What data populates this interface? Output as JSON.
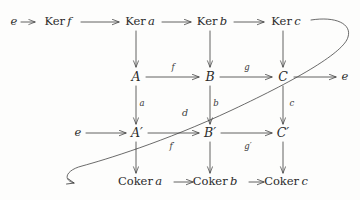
{
  "diagram": {
    "background_color": "#fdfdfc",
    "ink_color": "#3a3a3a",
    "text_color": "#2b2b2b",
    "rows": [
      {
        "name": "kernel-row",
        "nodes": [
          {
            "label": "e",
            "x": 14,
            "y": 22
          },
          {
            "label": "Ker f",
            "x": 58,
            "y": 22
          },
          {
            "label": "Ker a",
            "x": 140,
            "y": 22
          },
          {
            "label": "Ker b",
            "x": 212,
            "y": 22
          },
          {
            "label": "Ker c",
            "x": 286,
            "y": 22
          }
        ]
      },
      {
        "name": "top-exact-row",
        "nodes": [
          {
            "label": "A",
            "x": 136,
            "y": 77
          },
          {
            "label": "B",
            "x": 210,
            "y": 77
          },
          {
            "label": "C",
            "x": 283,
            "y": 77
          },
          {
            "label": "e",
            "x": 345,
            "y": 77
          }
        ]
      },
      {
        "name": "bottom-exact-row",
        "nodes": [
          {
            "label": "e",
            "x": 78,
            "y": 133
          },
          {
            "label": "A′",
            "x": 137,
            "y": 133
          },
          {
            "label": "B′",
            "x": 210,
            "y": 133
          },
          {
            "label": "C′",
            "x": 283,
            "y": 133
          }
        ]
      },
      {
        "name": "cokernel-row",
        "nodes": [
          {
            "label": "Coker a",
            "x": 140,
            "y": 182
          },
          {
            "label": "Coker b",
            "x": 215,
            "y": 182
          },
          {
            "label": "Coker c",
            "x": 286,
            "y": 182
          }
        ]
      }
    ],
    "arrow_labels": [
      {
        "name": "map-f",
        "label": "f",
        "x": 173,
        "y": 67
      },
      {
        "name": "map-g",
        "label": "g",
        "x": 247,
        "y": 67
      },
      {
        "name": "map-a",
        "label": "a",
        "x": 142,
        "y": 103
      },
      {
        "name": "map-b",
        "label": "b",
        "x": 216,
        "y": 103
      },
      {
        "name": "map-c",
        "label": "c",
        "x": 292,
        "y": 103
      },
      {
        "name": "connecting-map-d",
        "label": "d",
        "x": 185,
        "y": 112
      },
      {
        "name": "map-f-prime",
        "label": "f′",
        "x": 172,
        "y": 146
      },
      {
        "name": "map-g-prime",
        "label": "g′",
        "x": 248,
        "y": 146
      }
    ],
    "connecting_morphism": {
      "name": "snake-connecting-arrow",
      "from": "Ker c",
      "to": "Coker a",
      "label": "d"
    }
  }
}
